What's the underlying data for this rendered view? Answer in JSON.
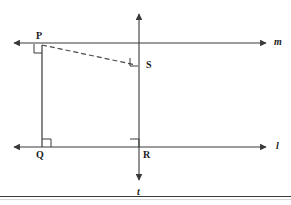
{
  "figure": {
    "type": "geometry-diagram",
    "background_color": "#ffffff",
    "stroke_color": "#3a3a3a",
    "dashed_stroke_color": "#4a4a4a",
    "points": [
      {
        "id": "P",
        "label": "P",
        "x": 42,
        "y": 45,
        "on_line": "m"
      },
      {
        "id": "S",
        "label": "S",
        "x": 139,
        "y": 65,
        "on_line": "t"
      },
      {
        "id": "Q",
        "label": "Q",
        "x": 42,
        "y": 147,
        "on_line": "l"
      },
      {
        "id": "R",
        "label": "R",
        "x": 139,
        "y": 147,
        "on_line": "l"
      }
    ],
    "lines": [
      {
        "id": "m",
        "label": "m",
        "orientation": "horizontal",
        "y": 43,
        "x_start": 12,
        "x_end": 268,
        "arrows": "both",
        "style": "solid"
      },
      {
        "id": "l",
        "label": "l",
        "orientation": "horizontal",
        "y": 147,
        "x_start": 12,
        "x_end": 268,
        "arrows": "both",
        "style": "solid"
      },
      {
        "id": "t",
        "label": "t",
        "orientation": "vertical",
        "x": 139,
        "y_start": 12,
        "y_end": 182,
        "arrows": "both",
        "style": "solid"
      }
    ],
    "segments": [
      {
        "id": "PQ",
        "from": "P",
        "to": "Q",
        "style": "solid",
        "x1": 42,
        "y1": 45,
        "x2": 42,
        "y2": 147
      },
      {
        "id": "PS",
        "from": "P",
        "to": "S",
        "style": "dashed",
        "x1": 42,
        "y1": 45,
        "x2": 137,
        "y2": 65
      }
    ],
    "right_angle_marks": [
      {
        "id": "angle-at-P",
        "at_point": "P",
        "x": 42,
        "y": 45,
        "dx": -1,
        "dy": 1,
        "size": 8
      },
      {
        "id": "angle-at-S",
        "at_point": "S",
        "x": 139,
        "y": 65,
        "dx": -1,
        "dy": -1,
        "size": 8
      },
      {
        "id": "angle-at-Q",
        "at_point": "Q",
        "x": 42,
        "y": 147,
        "dx": 1,
        "dy": -1,
        "size": 8
      },
      {
        "id": "angle-at-R",
        "at_point": "R",
        "x": 139,
        "y": 147,
        "dx": -1,
        "dy": -1,
        "size": 8
      }
    ]
  },
  "labels": {
    "P": "P",
    "S": "S",
    "Q": "Q",
    "R": "R",
    "m": "m",
    "l": "l",
    "t": "t"
  },
  "colors": {
    "stroke": "#3a3a3a",
    "dashed": "#4a4a4a",
    "text": "#1a1a1a",
    "rule": "#3a3a3a",
    "background": "#ffffff"
  }
}
